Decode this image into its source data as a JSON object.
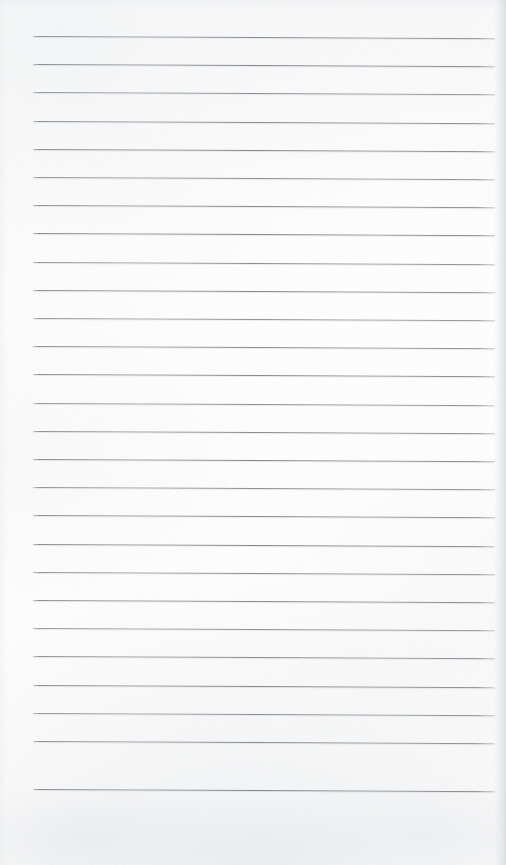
{
  "image": {
    "kind": "scanned-document",
    "subject": "blank lined notebook paper",
    "orientation": "portrait",
    "width_px": 506,
    "height_px": 865,
    "visible_text": [],
    "handwriting_present": false,
    "printed_text_present": false
  },
  "paper": {
    "background_color": "#fefefe",
    "tone_color": "#fdfdfd",
    "texture_color": "#eceef0",
    "bottom_blotch_color": "#e3e6e9",
    "right_edge_shadow_color": "#d6dadf",
    "left_edge_shadow_color": "#e8eaed"
  },
  "ruling": {
    "style": "horizontal-ruled",
    "line_color": "#787c83",
    "line_halo_color": "#c8cbd0",
    "line_thickness_px": 1,
    "line_count": 27,
    "first_line_y_px": 36,
    "line_spacing_px": 28.2,
    "line_left_x_px": 33,
    "line_right_x_px": 495,
    "line_length_px": 462,
    "skew_degrees": 0.28,
    "margin_top_px": 36,
    "margin_bottom_px": 76,
    "margin_left_px": 33,
    "margin_right_px": 11,
    "vertical_margin_rule_present": false,
    "lines": [
      {
        "index": 1,
        "y_px": 36.0,
        "content": ""
      },
      {
        "index": 2,
        "y_px": 64.2,
        "content": ""
      },
      {
        "index": 3,
        "y_px": 92.4,
        "content": ""
      },
      {
        "index": 4,
        "y_px": 120.6,
        "content": ""
      },
      {
        "index": 5,
        "y_px": 148.8,
        "content": ""
      },
      {
        "index": 6,
        "y_px": 177.0,
        "content": ""
      },
      {
        "index": 7,
        "y_px": 205.2,
        "content": ""
      },
      {
        "index": 8,
        "y_px": 233.4,
        "content": ""
      },
      {
        "index": 9,
        "y_px": 261.6,
        "content": ""
      },
      {
        "index": 10,
        "y_px": 289.8,
        "content": ""
      },
      {
        "index": 11,
        "y_px": 318.0,
        "content": ""
      },
      {
        "index": 12,
        "y_px": 346.2,
        "content": ""
      },
      {
        "index": 13,
        "y_px": 374.4,
        "content": ""
      },
      {
        "index": 14,
        "y_px": 402.6,
        "content": ""
      },
      {
        "index": 15,
        "y_px": 430.8,
        "content": ""
      },
      {
        "index": 16,
        "y_px": 459.0,
        "content": ""
      },
      {
        "index": 17,
        "y_px": 487.2,
        "content": ""
      },
      {
        "index": 18,
        "y_px": 515.4,
        "content": ""
      },
      {
        "index": 19,
        "y_px": 543.6,
        "content": ""
      },
      {
        "index": 20,
        "y_px": 571.8,
        "content": ""
      },
      {
        "index": 21,
        "y_px": 600.0,
        "content": ""
      },
      {
        "index": 22,
        "y_px": 628.2,
        "content": ""
      },
      {
        "index": 23,
        "y_px": 656.4,
        "content": ""
      },
      {
        "index": 24,
        "y_px": 684.6,
        "content": ""
      },
      {
        "index": 25,
        "y_px": 712.8,
        "content": ""
      },
      {
        "index": 26,
        "y_px": 741.0,
        "content": ""
      },
      {
        "index": 27,
        "y_px": 789.0,
        "content": ""
      }
    ]
  }
}
